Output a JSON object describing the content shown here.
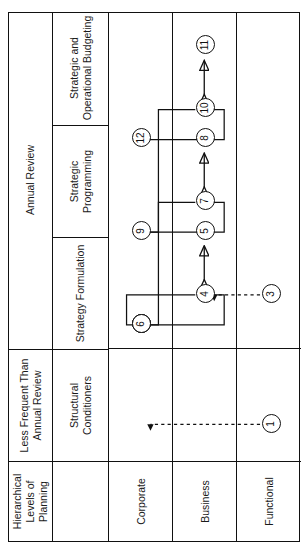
{
  "figure": {
    "number": "Figure 4.3",
    "title": "The Formal Corporate Strategic Planning Process"
  },
  "table": {
    "corner_header": "Hierarchical Levels of Planning",
    "header_groups": [
      {
        "label": "Less Frequent Than Annual Review",
        "span": 1
      },
      {
        "label": "Annual Review",
        "span": 3
      }
    ],
    "columns": [
      "Structural Conditioners",
      "Strategy Formulation",
      "Strategic Programming",
      "Strategic and Operational Budgeting"
    ],
    "rows": [
      "Corporate",
      "Business",
      "Functional"
    ]
  },
  "diagram": {
    "nodes": [
      {
        "id": "1",
        "label": "1",
        "column": "Structural Conditioners",
        "row": "Corporate"
      },
      {
        "id": "2",
        "label": "2",
        "column": "Strategy Formulation",
        "row": "Corporate"
      },
      {
        "id": "3",
        "label": "3",
        "column": "Structural Conditioners",
        "row": "Business"
      },
      {
        "id": "4",
        "label": "4",
        "column": "Strategy Formulation",
        "row": "Business"
      },
      {
        "id": "5",
        "label": "5",
        "column": "Strategy Formulation",
        "row": "Functional"
      },
      {
        "id": "6",
        "label": "6",
        "column": "Strategy Formulation",
        "row": "Corporate"
      },
      {
        "id": "7",
        "label": "7",
        "column": "Strategic Programming",
        "row": "Business"
      },
      {
        "id": "8",
        "label": "8",
        "column": "Strategic Programming",
        "row": "Functional"
      },
      {
        "id": "9",
        "label": "9",
        "column": "Strategic Programming",
        "row": "Corporate"
      },
      {
        "id": "10",
        "label": "10",
        "column": "Strategic and Operational Budgeting",
        "row": "Business"
      },
      {
        "id": "11",
        "label": "11",
        "column": "Strategic and Operational Budgeting",
        "row": "Functional"
      },
      {
        "id": "12",
        "label": "12",
        "column": "Strategic and Operational Budgeting",
        "row": "Corporate"
      }
    ],
    "dashed_arrows": [
      {
        "from": "1",
        "to": "2"
      },
      {
        "from": "3",
        "to": "4"
      }
    ],
    "solid_paths": [
      {
        "from": "2",
        "to": "4"
      },
      {
        "from": "4",
        "to": "6"
      },
      {
        "from": "6",
        "to": "7"
      },
      {
        "from": "7",
        "to": "9"
      },
      {
        "from": "9",
        "to": "10"
      },
      {
        "from": "10",
        "to": "12"
      }
    ],
    "double_arrows": [
      {
        "from": "4",
        "to": "5"
      },
      {
        "from": "7",
        "to": "8"
      },
      {
        "from": "10",
        "to": "11"
      }
    ],
    "line_color": "#111111"
  }
}
